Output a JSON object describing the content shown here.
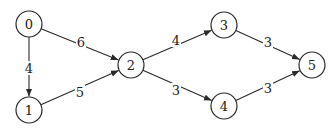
{
  "diagram": {
    "type": "weighted-directed-graph",
    "colors": {
      "stroke": "#2a2a2a",
      "text": "#222222",
      "background": "#ffffff"
    },
    "node_radius": 13,
    "nodes": [
      {
        "id": "0",
        "label": "0",
        "x": 29,
        "y": 24
      },
      {
        "id": "1",
        "label": "1",
        "x": 29,
        "y": 110
      },
      {
        "id": "2",
        "label": "2",
        "x": 131,
        "y": 65
      },
      {
        "id": "3",
        "label": "3",
        "x": 224,
        "y": 25
      },
      {
        "id": "4",
        "label": "4",
        "x": 224,
        "y": 106
      },
      {
        "id": "5",
        "label": "5",
        "x": 312,
        "y": 65
      }
    ],
    "edges": [
      {
        "from": "0",
        "to": "1",
        "weight": "4",
        "lx": 29,
        "ly": 68
      },
      {
        "from": "0",
        "to": "2",
        "weight": "6",
        "lx": 81,
        "ly": 42
      },
      {
        "from": "1",
        "to": "2",
        "weight": "5",
        "lx": 80,
        "ly": 92
      },
      {
        "from": "2",
        "to": "3",
        "weight": "4",
        "lx": 176,
        "ly": 40
      },
      {
        "from": "2",
        "to": "4",
        "weight": "3",
        "lx": 176,
        "ly": 90
      },
      {
        "from": "3",
        "to": "5",
        "weight": "3",
        "lx": 268,
        "ly": 42
      },
      {
        "from": "4",
        "to": "5",
        "weight": "3",
        "lx": 268,
        "ly": 88
      }
    ]
  }
}
